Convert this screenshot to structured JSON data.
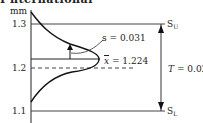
{
  "heading": "I nternational",
  "unit_label": "mm",
  "y_ticks": [
    {
      "label": "1.3",
      "value": 1.3
    },
    {
      "label": "1.2",
      "value": 1.2
    },
    {
      "label": "1.1",
      "value": 1.1
    }
  ],
  "limits": {
    "upper": {
      "symbol": "S",
      "subscript": "U",
      "value": 1.3
    },
    "lower": {
      "symbol": "S",
      "subscript": "L",
      "value": 1.1
    }
  },
  "tolerance": {
    "symbol": "T",
    "text": "= 0.02"
  },
  "std_dev": {
    "symbol": "s",
    "text": "s = 0.031",
    "value": 0.031
  },
  "mean": {
    "symbol": "x",
    "text": "= 1.224",
    "value": 1.224
  },
  "nominal": {
    "value": 1.2,
    "style": "dashed"
  }
}
